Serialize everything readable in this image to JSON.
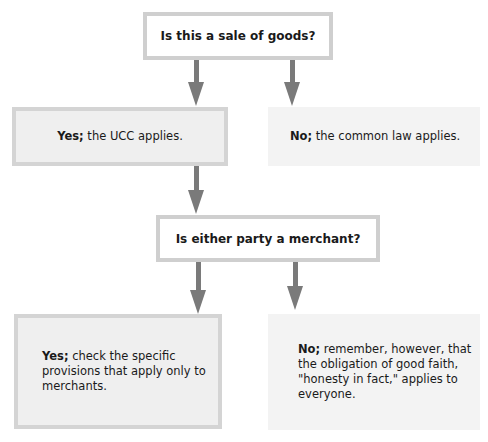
{
  "diagram": {
    "type": "flowchart",
    "nodes": {
      "q1": {
        "text": "Is this a sale of goods?"
      },
      "yes1": {
        "lead": "Yes;",
        "text": " the UCC applies."
      },
      "no1": {
        "lead": "No;",
        "text": " the common law applies."
      },
      "q2": {
        "text": "Is either party a merchant?"
      },
      "yes2": {
        "lead": "Yes;",
        "text": " check the specific provisions that apply only to merchants."
      },
      "no2": {
        "lead": "No;",
        "text": " remember, however, that the obligation of good faith, \"honesty in fact,\"  applies to everyone."
      }
    },
    "edges": [
      {
        "from": "q1",
        "to": "yes1"
      },
      {
        "from": "q1",
        "to": "no1"
      },
      {
        "from": "yes1",
        "to": "q2"
      },
      {
        "from": "q2",
        "to": "yes2"
      },
      {
        "from": "q2",
        "to": "no2"
      }
    ],
    "colors": {
      "arrow": "#7a7a7a",
      "question_border": "#cfcfcf",
      "yes_fill": "#efefef",
      "no_fill": "#f3f3f3"
    }
  }
}
